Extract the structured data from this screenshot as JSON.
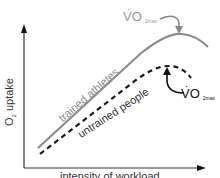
{
  "diagram": {
    "y_axis_label": "O",
    "y_axis_label_sub": "2",
    "y_axis_label_rest": " uptake",
    "x_axis_label": "intensity of workload",
    "series": [
      {
        "name": "trained athletes",
        "style": "solid",
        "color": "#8c8c8c"
      },
      {
        "name": "untrained people",
        "style": "dashed",
        "color": "#1a1a1a"
      }
    ],
    "annotations": [
      {
        "text": "VO",
        "sub": "2max",
        "dot": "·",
        "target": "trained athletes peak",
        "color": "#999999"
      },
      {
        "text": "VO",
        "sub": "2max",
        "dot": "·",
        "target": "untrained people peak",
        "color": "#111111"
      }
    ]
  }
}
